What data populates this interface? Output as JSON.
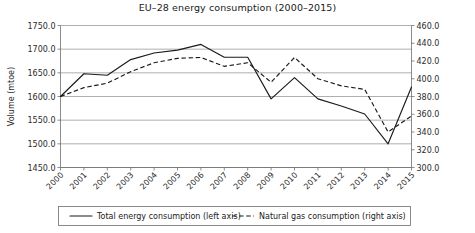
{
  "chart_data": {
    "type": "line",
    "title": "EU–28 energy consumption (2000–2015)",
    "xlabel": "",
    "ylabel": "Volume (mtoe)",
    "y2label": "",
    "grid": true,
    "legend_position": "bottom",
    "categories": [
      "2000",
      "2001",
      "2002",
      "2003",
      "2004",
      "2005",
      "2006",
      "2007",
      "2008",
      "2009",
      "2010",
      "2011",
      "2012",
      "2013",
      "2014",
      "2015"
    ],
    "x": [
      2000,
      2001,
      2002,
      2003,
      2004,
      2005,
      2006,
      2007,
      2008,
      2009,
      2010,
      2011,
      2012,
      2013,
      2014,
      2015
    ],
    "ylim": [
      1450.0,
      1750.0
    ],
    "y2lim": [
      300.0,
      460.0
    ],
    "yticks": [
      "1450.0",
      "1500.0",
      "1550.0",
      "1600.0",
      "1650.0",
      "1700.0",
      "1750.0"
    ],
    "ytick_values": [
      1450.0,
      1500.0,
      1550.0,
      1600.0,
      1650.0,
      1700.0,
      1750.0
    ],
    "y2ticks": [
      "300.0",
      "320.0",
      "340.0",
      "360.0",
      "380.0",
      "400.0",
      "420.0",
      "440.0",
      "460.0"
    ],
    "y2tick_values": [
      300.0,
      320.0,
      340.0,
      360.0,
      380.0,
      400.0,
      420.0,
      440.0,
      460.0
    ],
    "series": [
      {
        "name": "Total energy consumption (left axis)",
        "axis": "left",
        "style": "solid",
        "color": "#1a1a1a",
        "values": [
          1600,
          1648,
          1645,
          1678,
          1692,
          1698,
          1710,
          1683,
          1683,
          1595,
          1640,
          1595,
          1580,
          1563,
          1500,
          1620
        ]
      },
      {
        "name": "Natural gas consumption (right axis)",
        "axis": "right",
        "style": "dashed",
        "color": "#1a1a1a",
        "values": [
          380,
          390,
          395,
          408,
          418,
          423,
          424,
          414,
          418,
          396,
          424,
          400,
          392,
          388,
          340,
          358
        ]
      }
    ]
  },
  "legend": {
    "items": [
      {
        "label": "Total energy consumption (left axis)",
        "style": "solid"
      },
      {
        "label": "Natural gas consumption (right axis)",
        "style": "dashed"
      }
    ]
  }
}
